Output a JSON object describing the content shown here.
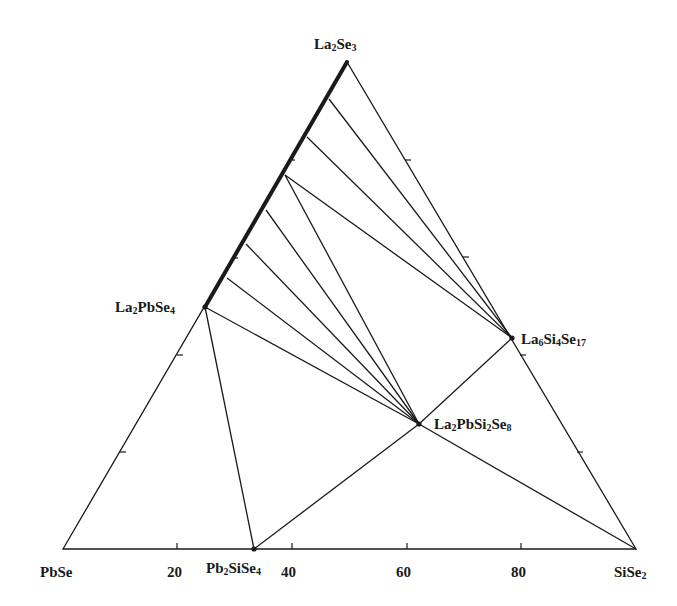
{
  "diagram": {
    "type": "ternary phase diagram",
    "vertices": {
      "top": {
        "label_parts": [
          [
            "La",
            false
          ],
          [
            "2",
            true
          ],
          [
            "Se",
            false
          ],
          [
            "3",
            true
          ]
        ],
        "text": "La2Se3"
      },
      "bottom_left": {
        "label_parts": [
          [
            "PbSe",
            false
          ]
        ],
        "text": "PbSe"
      },
      "bottom_right": {
        "label_parts": [
          [
            "SiSe",
            false
          ],
          [
            "2",
            true
          ]
        ],
        "text": "SiSe2"
      }
    },
    "phases": [
      {
        "id": "La2PbSe4",
        "label_parts": [
          [
            "La",
            false
          ],
          [
            "2",
            true
          ],
          [
            "PbSe",
            false
          ],
          [
            "4",
            true
          ]
        ],
        "text": "La2PbSe4"
      },
      {
        "id": "La6Si4Se17",
        "label_parts": [
          [
            "La",
            false
          ],
          [
            "6",
            true
          ],
          [
            "Si",
            false
          ],
          [
            "4",
            true
          ],
          [
            "Se",
            false
          ],
          [
            "17",
            true
          ]
        ],
        "text": "La6Si4Se17"
      },
      {
        "id": "La2PbSi2Se8",
        "label_parts": [
          [
            "La",
            false
          ],
          [
            "2",
            true
          ],
          [
            "PbSi",
            false
          ],
          [
            "2",
            true
          ],
          [
            "Se",
            false
          ],
          [
            "8",
            true
          ]
        ],
        "text": "La2PbSi2Se8"
      },
      {
        "id": "Pb2SiSe4",
        "label_parts": [
          [
            "Pb",
            false
          ],
          [
            "2",
            true
          ],
          [
            "SiSe",
            false
          ],
          [
            "4",
            true
          ]
        ],
        "text": "Pb2SiSe4"
      }
    ],
    "bottom_axis_ticks": [
      "20",
      "40",
      "60",
      "80"
    ],
    "solid_solution_segment": "La2Se3 – La2PbSe4",
    "tie_lines": [
      "La2Se3-edge → La6Si4Se17 (3 lines)",
      "La2Se3-edge → La2PbSi2Se8 (5 lines)",
      "La2PbSe4 → Pb2SiSe4",
      "La2PbSe4 → La2PbSi2Se8 → SiSe2",
      "Pb2SiSe4 → La2PbSi2Se8",
      "La2PbSi2Se8 → La6Si4Se17"
    ]
  }
}
